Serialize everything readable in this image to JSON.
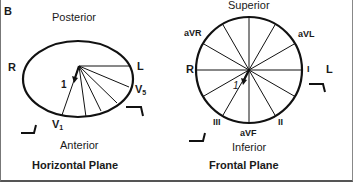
{
  "panel_label": "B",
  "horizontal_plane": {
    "title": "Horizontal Plane",
    "top_label": "Posterior",
    "bottom_label": "Anterior",
    "left_label": "R",
    "right_label": "L",
    "lead_v1": "V",
    "lead_v1_sub": "1",
    "lead_v5": "V",
    "lead_v5_sub": "5",
    "vector_label": "1"
  },
  "frontal_plane": {
    "title": "Frontal Plane",
    "top_label": "Superior",
    "bottom_label": "Inferior",
    "left_label": "R",
    "right_label": "L",
    "leads": {
      "avr": "aVR",
      "avl": "aVL",
      "i": "I",
      "ii": "II",
      "iii": "III",
      "avf": "aVF"
    },
    "vector_label": "1"
  },
  "colors": {
    "line": "#111111",
    "border": "#666666",
    "background": "#ffffff"
  }
}
